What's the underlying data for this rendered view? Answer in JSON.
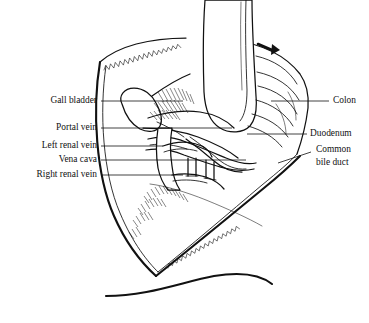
{
  "figure": {
    "background_color": "#ffffff",
    "ink_color": "#111111",
    "width": 369,
    "height": 323
  },
  "labels_left": [
    {
      "id": "gall-bladder",
      "text": "Gall bladder",
      "text_x": 97,
      "text_y": 101,
      "leader": "M101,101 L183,101"
    },
    {
      "id": "portal-vein",
      "text": "Portal vein",
      "text_x": 97,
      "text_y": 128,
      "leader": "M101,128 L232,128"
    },
    {
      "id": "left-renal-vein",
      "text": "Left renal vein",
      "text_x": 97,
      "text_y": 146,
      "leader": "M101,146 L163,146"
    },
    {
      "id": "vena-cava",
      "text": "Vena cava",
      "text_x": 97,
      "text_y": 160,
      "leader": "M101,160 L246,160"
    },
    {
      "id": "right-renal-vein",
      "text": "Right renal vein",
      "text_x": 97,
      "text_y": 175,
      "leader": "M101,175 L183,175"
    }
  ],
  "labels_right": [
    {
      "id": "colon",
      "text": "Colon",
      "text_x": 333,
      "text_y": 101,
      "leader": "M329,101 L271,101"
    },
    {
      "id": "duodenum",
      "text": "Duodenum",
      "text_x": 310,
      "text_y": 134,
      "leader": "M307,134 L247,134"
    },
    {
      "id": "common-bile-duct-line1",
      "text": "Common",
      "text_x": 316,
      "text_y": 150,
      "leader": "M311,152 L278,163"
    },
    {
      "id": "common-bile-duct-line2",
      "text": "bile duct",
      "text_x": 316,
      "text_y": 163,
      "leader": ""
    }
  ],
  "annotations": {
    "retraction_arrow": "retraction-direction-arrow",
    "incision_edge": "laparotomy-wound-edge",
    "hatching": "cut-tissue-hatching"
  },
  "caption": {
    "clipped_text": ""
  }
}
